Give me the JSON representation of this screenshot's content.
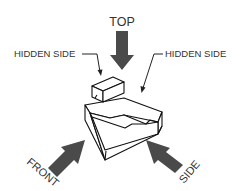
{
  "diagram": {
    "type": "orthographic-view-directions",
    "labels": {
      "top": "TOP",
      "hidden_side_left": "HIDDEN SIDE",
      "hidden_side_right": "HIDDEN SIDE",
      "front": "FRONT",
      "side": "SIDE"
    },
    "arrows": [
      {
        "name": "top",
        "direction": "down"
      },
      {
        "name": "front",
        "direction": "up-right"
      },
      {
        "name": "side",
        "direction": "up-left"
      }
    ],
    "colors": {
      "arrow_fill": "#4a4a4a",
      "text": "#333333",
      "object_stroke": "#111111",
      "background": "#ffffff"
    }
  }
}
